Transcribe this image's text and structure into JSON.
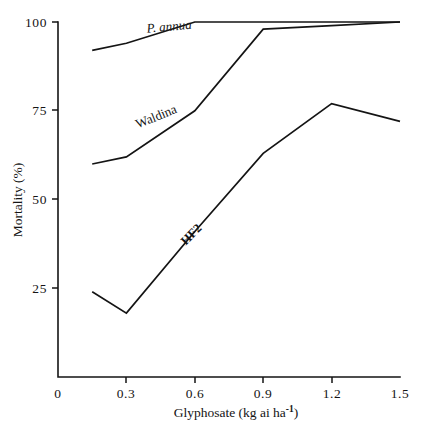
{
  "chart_data": {
    "type": "line",
    "title": "",
    "xlabel": "Glyphosate (kg ai ha-1)",
    "xlabel_base": "Glyphosate (kg ai ha",
    "xlabel_sup": "-1",
    "xlabel_tail": ")",
    "ylabel": "Mortality (%)",
    "xlim": [
      0,
      1.5
    ],
    "ylim": [
      0,
      100
    ],
    "grid": false,
    "legend": "inline-curve-labels",
    "xticks": [
      0,
      0.3,
      0.6,
      0.9,
      1.2,
      1.5
    ],
    "xtick_labels": [
      "0",
      "0.3",
      "0.6",
      "0.9",
      "1.2",
      "1.5"
    ],
    "yticks": [
      25,
      50,
      75,
      100
    ],
    "ytick_labels": [
      "25",
      "50",
      "75",
      "100"
    ],
    "x": [
      0.15,
      0.3,
      0.6,
      0.9,
      1.2,
      1.5
    ],
    "series": [
      {
        "name": "P. annua",
        "label_style": "italic",
        "values": [
          92,
          94,
          100,
          100,
          100,
          100
        ]
      },
      {
        "name": "Waldina",
        "label_style": "normal",
        "values": [
          60,
          62,
          75,
          98,
          99,
          100
        ]
      },
      {
        "name": "HF2",
        "label_style": "bold",
        "values": [
          24,
          18,
          41,
          63,
          77,
          72
        ]
      }
    ],
    "annotations": [
      {
        "text": "P. annua",
        "x": 0.39,
        "y": 97,
        "rotation": -5,
        "style": "italic"
      },
      {
        "text": "Waldina",
        "x": 0.35,
        "y": 70,
        "rotation": -22,
        "style": "normal"
      },
      {
        "text": "HF2",
        "x": 0.56,
        "y": 37,
        "rotation": -45,
        "style": "bold"
      }
    ],
    "colors": {
      "line": "#141414",
      "axis": "#141414",
      "background": "#ffffff"
    }
  }
}
